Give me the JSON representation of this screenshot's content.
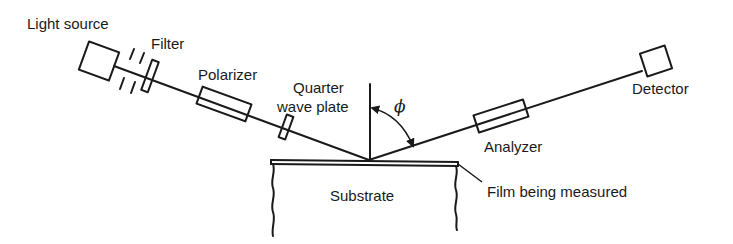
{
  "labels": {
    "light_source": "Light source",
    "filter": "Filter",
    "polarizer": "Polarizer",
    "quarter_wave_line1": "Quarter",
    "quarter_wave_line2": "wave plate",
    "angle": "ϕ",
    "detector": "Detector",
    "analyzer": "Analyzer",
    "substrate": "Substrate",
    "film": "Film being measured"
  },
  "colors": {
    "ink": "#1a1a1a",
    "background": "#ffffff"
  }
}
